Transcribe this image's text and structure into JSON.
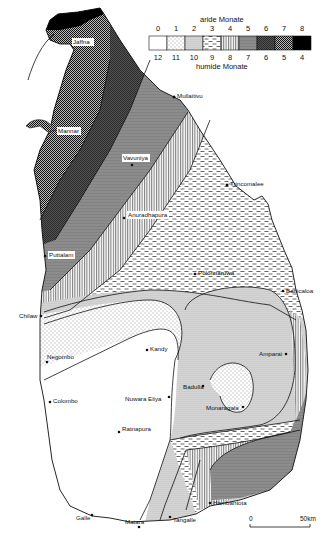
{
  "legend": {
    "title_top": "aride Monate",
    "title_bottom": "humide Monate",
    "arid_months": [
      "0",
      "1",
      "2",
      "3",
      "4",
      "5",
      "6",
      "7",
      "8"
    ],
    "humid_months": [
      "12",
      "11",
      "10",
      "9",
      "8",
      "7",
      "6",
      "5",
      "4"
    ],
    "patterns": [
      "white",
      "sparse-dots",
      "dense-dots",
      "dashes",
      "vertical-lines",
      "grey",
      "dark-checker",
      "dense-checker",
      "black"
    ]
  },
  "places": {
    "jaffna": "Jaffna",
    "mullaitivu": "Mullaitivu",
    "mannar": "Mannar",
    "vavuniya": "Vavuniya",
    "trincomalee": "Trincomalee",
    "anuradhapura": "Anuradhapura",
    "puttalam": "Puttalam",
    "polonnaruwa": "Polonnaruwa",
    "chilaw": "Chilaw",
    "batticaloa": "Batticaloa",
    "kandy": "Kandy",
    "negombo": "Negombo",
    "amparai": "Amparai",
    "badulla": "Badulla",
    "colombo": "Colombo",
    "nuwara_eliya": "Nuwara Eliya",
    "monaragala": "Monaragala",
    "ratnapura": "Ratnapura",
    "hambantota": "Hambantota",
    "galle": "Galle",
    "matara": "Matara",
    "tangalle": "Tangalle"
  },
  "scale": {
    "start": "0",
    "end": "50km"
  }
}
